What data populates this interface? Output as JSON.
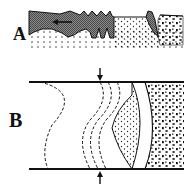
{
  "panels": [
    {
      "id": "A",
      "label": "A",
      "description": "Cross-section showing dark shaded body with jagged teeth on the left moving leftward over a fine dotted substrate, a dark wedge, and a coarse-dotted block on the right",
      "arrow": {
        "direction": "left",
        "icon": "arrow-left-icon"
      }
    },
    {
      "id": "B",
      "label": "B",
      "description": "Plan view between two horizontal bounding lines: several dashed wavy curves, a solid lens-shaped body filled with fine dots, a curved white band, and a coarse-dotted region on the right",
      "arrows": [
        {
          "position": "top",
          "direction": "down",
          "icon": "arrow-down-icon"
        },
        {
          "position": "bottom",
          "direction": "up",
          "icon": "arrow-up-icon"
        }
      ]
    }
  ],
  "colors": {
    "ink": "#111111",
    "shaded_fill": "#6e6e6e",
    "background": "#ffffff"
  }
}
